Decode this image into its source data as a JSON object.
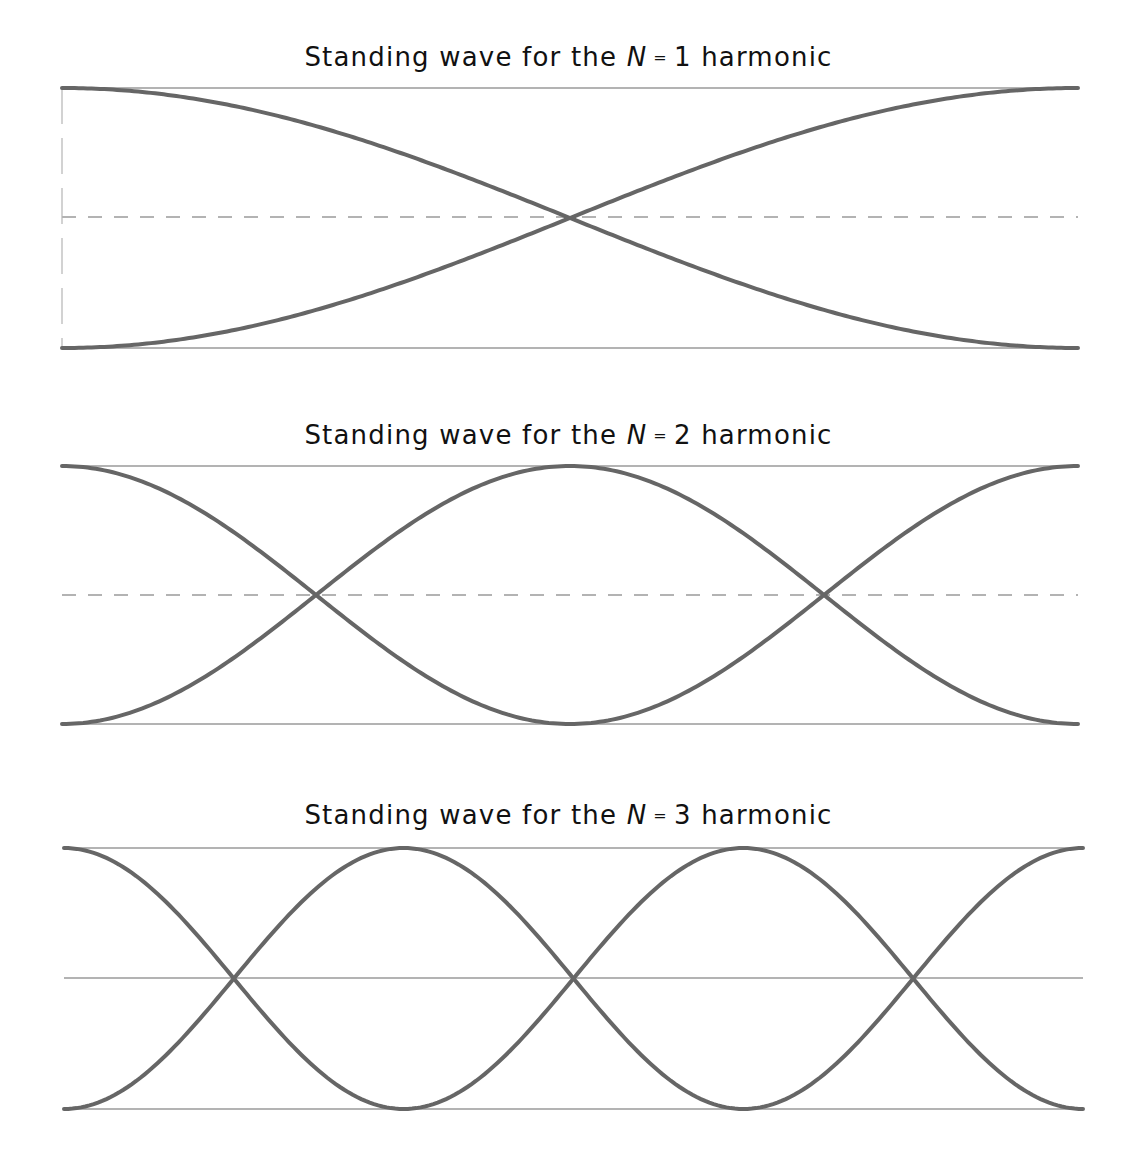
{
  "figure": {
    "background": "#ffffff",
    "curve_color": "#666666",
    "guide_color": "#9a9a9a",
    "panels": [
      {
        "title_prefix": "Standing wave for the",
        "title_var": "N",
        "title_eq": "=",
        "title_suffix": "1 harmonic",
        "n": 1,
        "title_y": 42,
        "x0": 62,
        "x1": 1078,
        "y_top": 88,
        "y_mid": 217,
        "y_bot": 348,
        "center_line": "dashed",
        "left_edge": "dashed"
      },
      {
        "title_prefix": "Standing wave for the",
        "title_var": "N",
        "title_eq": "=",
        "title_suffix": "2 harmonic",
        "n": 2,
        "title_y": 420,
        "x0": 62,
        "x1": 1078,
        "y_top": 466,
        "y_mid": 595,
        "y_bot": 724,
        "center_line": "dashed",
        "left_edge": "none"
      },
      {
        "title_prefix": "Standing wave for the",
        "title_var": "N",
        "title_eq": "=",
        "title_suffix": "3 harmonic",
        "n": 3,
        "title_y": 800,
        "x0": 64,
        "x1": 1083,
        "y_top": 848,
        "y_mid": 978,
        "y_bot": 1109,
        "center_line": "solid",
        "left_edge": "none"
      }
    ]
  }
}
